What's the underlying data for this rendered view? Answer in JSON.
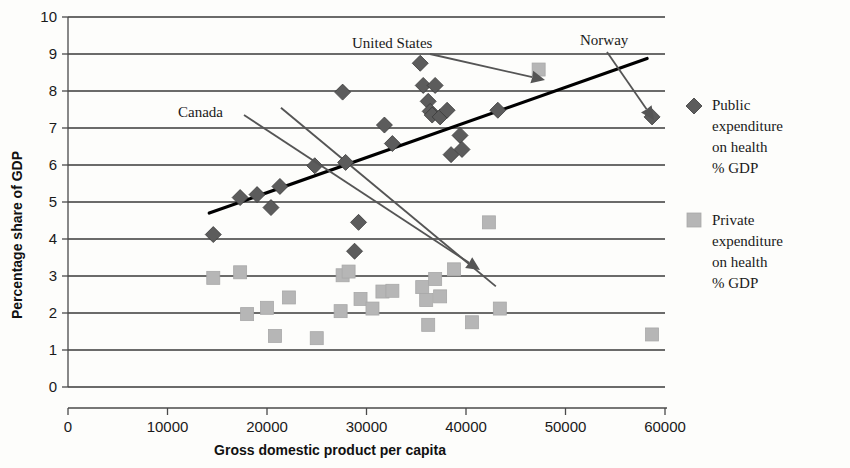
{
  "chart_data": {
    "type": "scatter",
    "title": "",
    "xlabel": "Gross domestic product per capita",
    "ylabel": "Percentage share of GDP",
    "xlim": [
      0,
      60000
    ],
    "ylim": [
      0,
      10
    ],
    "grid": true,
    "xticks": [
      0,
      10000,
      20000,
      30000,
      40000,
      50000,
      60000
    ],
    "xtick_labels": [
      "0",
      "10000",
      "20000",
      "30000",
      "40000",
      "50000",
      "60000"
    ],
    "yticks": [
      0,
      1,
      2,
      3,
      4,
      5,
      6,
      7,
      8,
      9,
      10
    ],
    "ytick_labels": [
      "0",
      "1",
      "2",
      "3",
      "4",
      "5",
      "6",
      "7",
      "8",
      "9",
      "10"
    ],
    "legend_position": "right",
    "series": [
      {
        "name": "Public expenditure on health % GDP",
        "marker": "diamond",
        "color": "#5c5c5c",
        "points": [
          [
            14600,
            4.12
          ],
          [
            17300,
            5.12
          ],
          [
            19000,
            5.2
          ],
          [
            20400,
            4.85
          ],
          [
            21300,
            5.42
          ],
          [
            24800,
            5.98
          ],
          [
            27600,
            7.97
          ],
          [
            27900,
            6.07
          ],
          [
            28800,
            3.67
          ],
          [
            29200,
            4.45
          ],
          [
            31800,
            7.08
          ],
          [
            32600,
            6.58
          ],
          [
            35400,
            8.75
          ],
          [
            35700,
            8.15
          ],
          [
            36200,
            7.72
          ],
          [
            36400,
            7.45
          ],
          [
            36600,
            7.35
          ],
          [
            36900,
            8.15
          ],
          [
            37400,
            7.3
          ],
          [
            38100,
            7.48
          ],
          [
            38500,
            6.28
          ],
          [
            39400,
            6.8
          ],
          [
            39600,
            6.42
          ],
          [
            43200,
            7.48
          ],
          [
            58700,
            7.3
          ]
        ]
      },
      {
        "name": "Private expenditure on health % GDP",
        "marker": "square",
        "color": "#b6b6b6",
        "points": [
          [
            14600,
            2.95
          ],
          [
            17300,
            3.1
          ],
          [
            18000,
            1.97
          ],
          [
            20000,
            2.14
          ],
          [
            20800,
            1.38
          ],
          [
            22200,
            2.42
          ],
          [
            25000,
            1.32
          ],
          [
            27400,
            2.05
          ],
          [
            27600,
            3.02
          ],
          [
            28200,
            3.12
          ],
          [
            29400,
            2.38
          ],
          [
            30600,
            2.12
          ],
          [
            31600,
            2.58
          ],
          [
            32600,
            2.6
          ],
          [
            35600,
            2.7
          ],
          [
            36000,
            2.35
          ],
          [
            36200,
            1.68
          ],
          [
            36900,
            2.92
          ],
          [
            37400,
            2.45
          ],
          [
            38800,
            3.18
          ],
          [
            40600,
            1.75
          ],
          [
            42300,
            4.45
          ],
          [
            43400,
            2.12
          ],
          [
            47300,
            8.58
          ],
          [
            58700,
            1.42
          ]
        ]
      }
    ],
    "trendlines": [
      {
        "name": "public-trend",
        "from": [
          14200,
          4.7
        ],
        "to": [
          58200,
          8.88
        ],
        "color": "#000000"
      },
      {
        "name": "private-trend",
        "from": [
          21400,
          7.55
        ],
        "to": [
          43000,
          2.72
        ],
        "color": "#555555"
      }
    ],
    "annotations": [
      {
        "label": "United States",
        "text_x": 352,
        "text_y": 48,
        "arrow_from": [
          430,
          54
        ],
        "arrow_to": [
          545,
          80
        ]
      },
      {
        "label": "Norway",
        "text_x": 580,
        "text_y": 45,
        "arrow_from": [
          607,
          52
        ],
        "arrow_to": [
          654,
          120
        ]
      },
      {
        "label": "Canada",
        "text_x": 178,
        "text_y": 117,
        "arrow_from": [
          244,
          115
        ],
        "arrow_to": [
          480,
          270
        ]
      }
    ]
  },
  "legend": {
    "items": [
      {
        "marker": "diamond",
        "color": "#5c5c5c",
        "lines": [
          "Public",
          "expenditure",
          "on health",
          "% GDP"
        ]
      },
      {
        "marker": "square",
        "color": "#b6b6b6",
        "lines": [
          "Private",
          "expenditure",
          "on health",
          "% GDP"
        ]
      }
    ]
  }
}
